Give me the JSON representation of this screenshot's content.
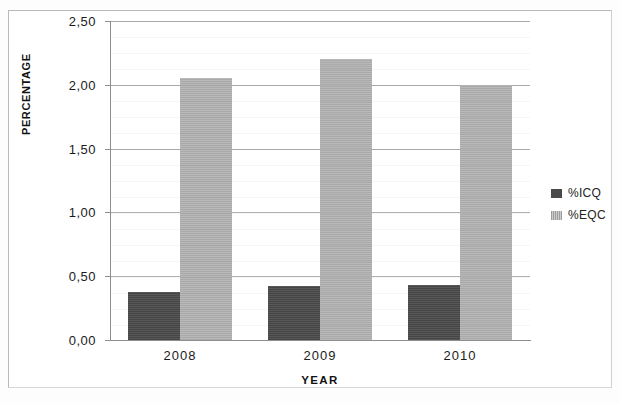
{
  "chart_data": {
    "type": "bar",
    "title": "",
    "xlabel": "YEAR",
    "ylabel": "PERCENTAGE",
    "categories": [
      "2008",
      "2009",
      "2010"
    ],
    "series": [
      {
        "name": "%ICQ",
        "color": "#4a4a4a",
        "values": [
          0.38,
          0.42,
          0.43
        ]
      },
      {
        "name": "%EQC",
        "color": "#b3b3b3",
        "values": [
          2.05,
          2.2,
          2.0
        ]
      }
    ],
    "ylim": [
      0,
      2.5
    ],
    "ytick_labels": [
      "0,00",
      "0,50",
      "1,00",
      "1,50",
      "2,00",
      "2,50"
    ],
    "ytick_values": [
      0,
      0.5,
      1.0,
      1.5,
      2.0,
      2.5
    ],
    "grid": true,
    "legend_position": "right",
    "decimal_separator": ","
  },
  "legend": {
    "items": [
      {
        "label": "%ICQ",
        "swatch": "legend-swatch-icq"
      },
      {
        "label": "%EQC",
        "swatch": "legend-swatch-eqc"
      }
    ]
  }
}
